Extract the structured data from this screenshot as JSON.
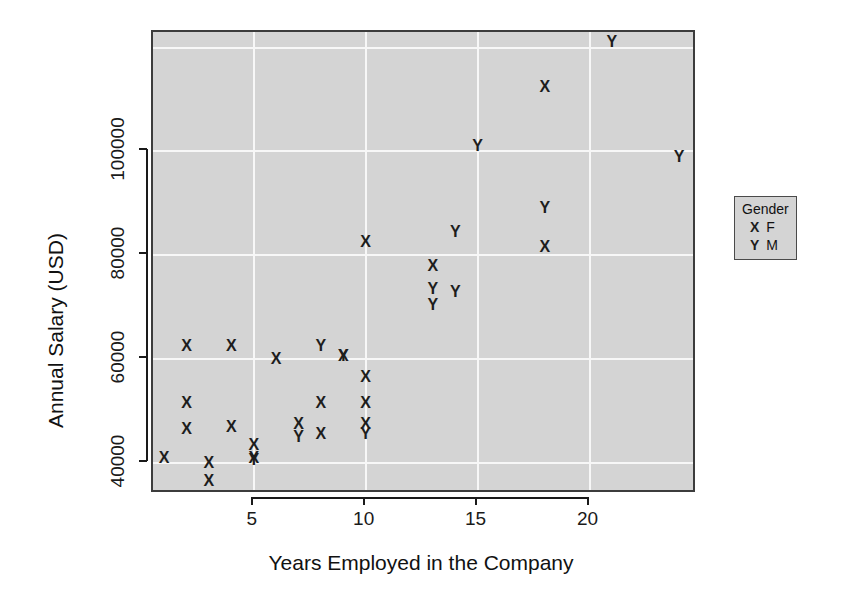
{
  "chart_data": {
    "type": "scatter",
    "title": "",
    "xlabel": "Years Employed in the Company",
    "ylabel": "Annual Salary (USD)",
    "xlim": [
      0.5,
      24.8
    ],
    "ylim": [
      34000,
      123000
    ],
    "xticks": [
      "5",
      "10",
      "15",
      "20"
    ],
    "xtick_values": [
      5,
      10,
      15,
      20
    ],
    "yticks": [
      "40000",
      "60000",
      "80000",
      "100000"
    ],
    "ytick_values": [
      40000,
      60000,
      80000,
      100000
    ],
    "grid": true,
    "grid_color": "#f7f7f7",
    "panel_color": "#d4d4d4",
    "point_color": "#1d1d1d",
    "legend": {
      "title": "Gender",
      "position": "right",
      "entries": [
        {
          "symbol": "X",
          "label": "F"
        },
        {
          "symbol": "Y",
          "label": "M"
        }
      ]
    },
    "series": [
      {
        "name": "F",
        "symbol": "X",
        "points": [
          {
            "x": 1,
            "y": 41000
          },
          {
            "x": 2,
            "y": 62500
          },
          {
            "x": 2,
            "y": 51500
          },
          {
            "x": 2,
            "y": 46500
          },
          {
            "x": 3,
            "y": 40000
          },
          {
            "x": 3,
            "y": 36500
          },
          {
            "x": 4,
            "y": 62500
          },
          {
            "x": 4,
            "y": 47000
          },
          {
            "x": 5,
            "y": 43500
          },
          {
            "x": 5,
            "y": 41000
          },
          {
            "x": 6,
            "y": 60000
          },
          {
            "x": 7,
            "y": 47500
          },
          {
            "x": 8,
            "y": 51500
          },
          {
            "x": 8,
            "y": 45500
          },
          {
            "x": 9,
            "y": 60500
          },
          {
            "x": 10,
            "y": 56500
          },
          {
            "x": 10,
            "y": 51500
          },
          {
            "x": 10,
            "y": 82500
          },
          {
            "x": 10,
            "y": 47500
          },
          {
            "x": 13,
            "y": 78000
          },
          {
            "x": 18,
            "y": 112500
          },
          {
            "x": 18,
            "y": 81500
          }
        ]
      },
      {
        "name": "M",
        "symbol": "Y",
        "points": [
          {
            "x": 5,
            "y": 40500
          },
          {
            "x": 7,
            "y": 45000
          },
          {
            "x": 8,
            "y": 62500
          },
          {
            "x": 9,
            "y": 60500
          },
          {
            "x": 10,
            "y": 45500
          },
          {
            "x": 13,
            "y": 73500
          },
          {
            "x": 13,
            "y": 70500
          },
          {
            "x": 14,
            "y": 84500
          },
          {
            "x": 14,
            "y": 73000
          },
          {
            "x": 15,
            "y": 101000
          },
          {
            "x": 18,
            "y": 89000
          },
          {
            "x": 21,
            "y": 121000
          },
          {
            "x": 24,
            "y": 99000
          }
        ]
      }
    ]
  }
}
